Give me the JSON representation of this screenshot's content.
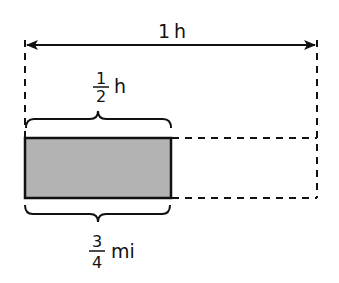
{
  "diagram": {
    "total_label": {
      "number": "1",
      "unit": "h"
    },
    "half_label": {
      "numerator": "1",
      "denominator": "2",
      "unit": "h"
    },
    "distance_label": {
      "numerator": "3",
      "denominator": "4",
      "unit": "mi"
    },
    "colors": {
      "fill": "#b3b3b3",
      "stroke": "#111111",
      "background": "#ffffff"
    }
  }
}
